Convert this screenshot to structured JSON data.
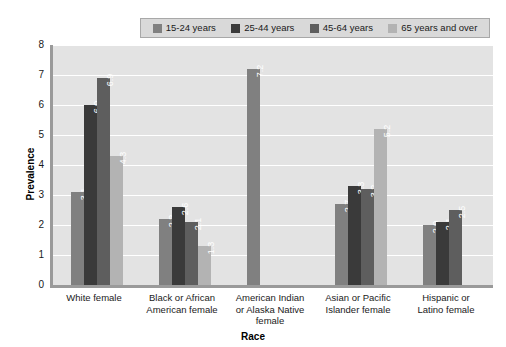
{
  "chart_data": {
    "type": "bar",
    "title": "",
    "xlabel": "Race",
    "ylabel": "Prevalence",
    "ylim": [
      0,
      8
    ],
    "yticks": [
      0,
      1,
      2,
      3,
      4,
      5,
      6,
      7,
      8
    ],
    "grid": "horizontal",
    "legend_position": "top",
    "categories": [
      "White female",
      "Black or African American female",
      "American Indian or Alaska Native female",
      "Asian or Pacific Islander female",
      "Hispanic or Latino female"
    ],
    "category_lines": [
      [
        "White female"
      ],
      [
        "Black or African",
        "American female"
      ],
      [
        "American Indian",
        "or Alaska Native",
        "female"
      ],
      [
        "Asian or Pacific",
        "Islander female"
      ],
      [
        "Hispanic or",
        "Latino female"
      ]
    ],
    "series": [
      {
        "name": "15-24 years",
        "color": "#808080",
        "values": [
          3.1,
          2.2,
          7.2,
          2.7,
          2.0
        ],
        "labels": [
          "3.1",
          "2.2",
          "7.2",
          "2.7",
          "2.0"
        ]
      },
      {
        "name": "25-44 years",
        "color": "#3a3a3a",
        "values": [
          6.0,
          2.6,
          null,
          3.3,
          2.1
        ],
        "labels": [
          "6.0",
          "2.6",
          "",
          "3.3",
          "2.1"
        ]
      },
      {
        "name": "45-64 years",
        "color": "#5e5e5e",
        "values": [
          6.9,
          2.1,
          null,
          3.2,
          2.5
        ],
        "labels": [
          "6.9",
          "2.1",
          "",
          "3.2",
          "2.5"
        ]
      },
      {
        "name": "65 years and over",
        "color": "#b3b3b3",
        "values": [
          4.3,
          1.3,
          null,
          5.2,
          null
        ],
        "labels": [
          "4.3",
          "1.3",
          "",
          "5.2",
          ""
        ]
      }
    ]
  },
  "style": {
    "plot_background": "#e3e3e3",
    "gridline_color": "#ffffff",
    "axis_color": "#9a9a9a",
    "legend_background": "#d9d9d9",
    "legend_border": "#a8a8a8",
    "value_label_color": "#ffffff"
  }
}
